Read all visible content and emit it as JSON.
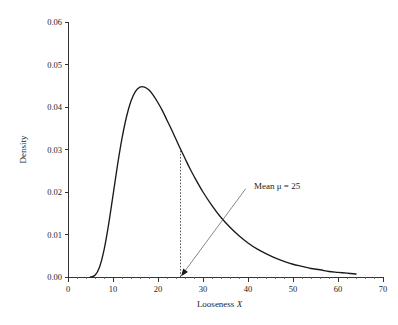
{
  "chart_data": {
    "type": "line",
    "title": "",
    "subtitle": "",
    "xlabel": "Looseness X",
    "xlabel_plain": "Looseness",
    "xlabel_italic": "X",
    "ylabel": "Density",
    "xlim": [
      0,
      70
    ],
    "ylim": [
      0.0,
      0.06
    ],
    "grid": false,
    "legend": null,
    "x_ticks": [
      0,
      10,
      20,
      30,
      40,
      50,
      60,
      70
    ],
    "x_tick_labels": [
      "0",
      "10",
      "20",
      "30",
      "40",
      "50",
      "60",
      "70"
    ],
    "x_minor_tick_step": 2,
    "y_ticks": [
      0.0,
      0.01,
      0.02,
      0.03,
      0.04,
      0.05,
      0.06
    ],
    "y_tick_labels": [
      "0.00",
      "0.01",
      "0.02",
      "0.03",
      "0.04",
      "0.05",
      "0.06"
    ],
    "series": [
      {
        "name": "Density of Looseness X",
        "x": [
          5,
          6,
          7,
          8,
          9,
          10,
          11,
          12,
          13,
          14,
          15,
          16,
          17,
          18,
          19,
          20,
          21,
          22,
          23,
          24,
          25,
          26,
          27,
          28,
          30,
          32,
          34,
          36,
          38,
          40,
          42,
          44,
          46,
          48,
          50,
          52,
          54,
          56,
          58,
          60,
          62,
          64
        ],
        "y": [
          0.0,
          0.0004,
          0.0023,
          0.0063,
          0.0122,
          0.0192,
          0.0263,
          0.0326,
          0.0377,
          0.0414,
          0.0437,
          0.0447,
          0.0447,
          0.044,
          0.0427,
          0.041,
          0.0391,
          0.0369,
          0.0347,
          0.0324,
          0.0301,
          0.0279,
          0.0257,
          0.0237,
          0.02,
          0.0168,
          0.014,
          0.0117,
          0.0097,
          0.008,
          0.0066,
          0.0055,
          0.0045,
          0.0037,
          0.003,
          0.0025,
          0.002,
          0.0017,
          0.0013,
          0.0011,
          0.0009,
          0.0007
        ]
      }
    ],
    "peak": {
      "x": 17,
      "y": 0.0447
    },
    "annotations": [
      {
        "name": "mean-annotation",
        "text": "Mean μ = 25",
        "text_parts": {
          "prefix": "Mean",
          "symbol": "μ",
          "equals": "=",
          "value": "25"
        },
        "points_to_x": 25,
        "points_to_y": 0.0,
        "label_x": 40,
        "label_y": 0.0215
      }
    ],
    "reference_lines": [
      {
        "name": "mean-dotted-line",
        "orientation": "vertical",
        "x": 25,
        "y_from": 0.0,
        "y_to": 0.0301,
        "style": "dotted"
      }
    ],
    "colors": {
      "curve": "#1a1a1a",
      "axis": "#333333",
      "text": "#1d1d1d",
      "dotted": "#444444",
      "leader": "#555555",
      "background": "#ffffff"
    }
  }
}
